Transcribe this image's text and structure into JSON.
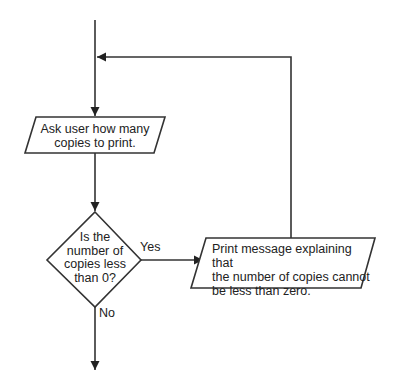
{
  "flowchart": {
    "nodes": {
      "ask_input": {
        "type": "io-parallelogram",
        "lines": [
          "Ask user how many",
          "copies to print."
        ]
      },
      "decision": {
        "type": "decision-diamond",
        "lines": [
          "Is the",
          "number of",
          "copies less",
          "than 0?"
        ]
      },
      "print_message": {
        "type": "io-parallelogram",
        "lines": [
          "Print message explaining that",
          "the number of copies cannot",
          "be less than zero."
        ]
      }
    },
    "edges": {
      "yes_label": "Yes",
      "no_label": "No"
    },
    "colors": {
      "stroke": "#333333",
      "text": "#222222",
      "background": "#ffffff"
    }
  }
}
